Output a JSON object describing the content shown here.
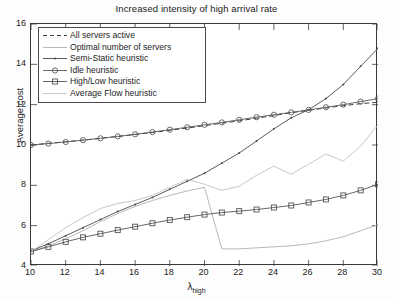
{
  "chart_data": {
    "type": "line",
    "title": "Increased intensity of high arrival rate",
    "xlabel": "λ",
    "xlabel_sub": "high",
    "ylabel": "Average cost",
    "xlim": [
      10,
      30
    ],
    "ylim": [
      4,
      16
    ],
    "xticks": [
      10,
      12,
      14,
      16,
      18,
      20,
      22,
      24,
      26,
      28,
      30
    ],
    "yticks": [
      4,
      6,
      8,
      10,
      12,
      14,
      16
    ],
    "grid": false,
    "legend_position": "top-left",
    "x": [
      10,
      11,
      12,
      13,
      14,
      15,
      16,
      17,
      18,
      19,
      20,
      21,
      22,
      23,
      24,
      25,
      26,
      27,
      28,
      29,
      30
    ],
    "series": [
      {
        "name": "All servers active",
        "style": "dashed",
        "color": "#3c3c3c",
        "marker": "none",
        "values": [
          10.0,
          10.08,
          10.16,
          10.24,
          10.33,
          10.42,
          10.52,
          10.62,
          10.73,
          10.84,
          10.96,
          11.08,
          11.2,
          11.33,
          11.46,
          11.6,
          11.72,
          11.84,
          11.95,
          12.05,
          12.12
        ]
      },
      {
        "name": "Optimal number of servers",
        "style": "solid",
        "color": "#b0b0b0",
        "marker": "none",
        "values": [
          4.7,
          5.0,
          5.35,
          5.75,
          6.2,
          6.6,
          6.95,
          7.25,
          7.5,
          7.72,
          7.9,
          4.85,
          4.85,
          4.9,
          4.95,
          5.0,
          5.1,
          5.25,
          5.45,
          5.75,
          6.05
        ]
      },
      {
        "name": "Semi-Static heuristic",
        "style": "solid",
        "color": "#4a4a4a",
        "marker": "dot",
        "values": [
          4.75,
          5.1,
          5.5,
          5.9,
          6.3,
          6.7,
          7.05,
          7.4,
          7.8,
          8.2,
          8.6,
          9.1,
          9.6,
          10.2,
          10.8,
          11.35,
          11.75,
          12.3,
          13.0,
          13.9,
          14.8
        ]
      },
      {
        "name": "Idle heuristic",
        "style": "solid",
        "color": "#5a5a5a",
        "marker": "circle",
        "values": [
          10.0,
          10.07,
          10.15,
          10.24,
          10.33,
          10.43,
          10.53,
          10.64,
          10.76,
          10.88,
          11.0,
          11.12,
          11.25,
          11.38,
          11.5,
          11.62,
          11.74,
          11.87,
          12.0,
          12.15,
          12.3
        ]
      },
      {
        "name": "High/Low heuristic",
        "style": "solid",
        "color": "#555555",
        "marker": "square",
        "values": [
          4.72,
          4.95,
          5.2,
          5.42,
          5.6,
          5.78,
          5.95,
          6.12,
          6.28,
          6.42,
          6.55,
          6.65,
          6.72,
          6.8,
          6.9,
          7.0,
          7.15,
          7.3,
          7.5,
          7.75,
          8.05
        ]
      },
      {
        "name": "Average Flow heuristic",
        "style": "solid",
        "color": "#c2c2c2",
        "marker": "none",
        "values": [
          4.72,
          5.3,
          5.9,
          6.4,
          6.85,
          7.1,
          7.25,
          7.5,
          7.9,
          8.3,
          8.05,
          7.75,
          7.95,
          8.5,
          8.95,
          8.55,
          9.05,
          9.55,
          9.2,
          9.95,
          11.0
        ]
      }
    ]
  }
}
